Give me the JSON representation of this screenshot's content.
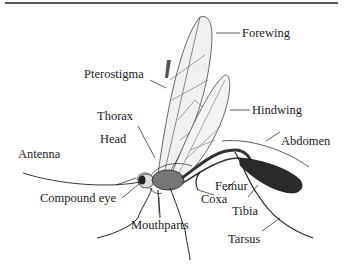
{
  "diagram": {
    "labels": {
      "forewing": "Forewing",
      "pterostigma": "Pterostigma",
      "hindwing": "Hindwing",
      "thorax": "Thorax",
      "head": "Head",
      "abdomen": "Abdomen",
      "antenna": "Antenna",
      "compound_eye": "Compound eye",
      "femur": "Femur",
      "coxa": "Coxa",
      "tibia": "Tibia",
      "mouthparts": "Mouthparts",
      "tarsus": "Tarsus"
    },
    "colors": {
      "line": "#333333",
      "wing_fill": "#f0f0f0",
      "body_dark": "#2a2a2a",
      "text": "#222222"
    }
  }
}
